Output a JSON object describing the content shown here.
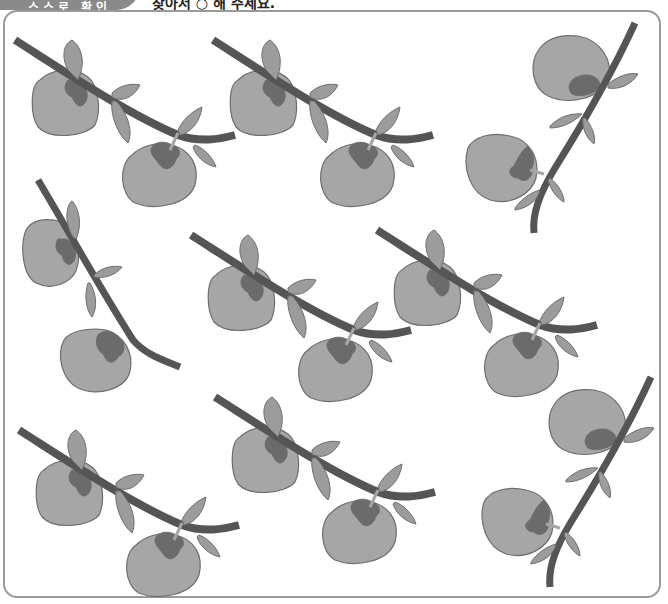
{
  "header": {
    "badge_text": "스스로 확인",
    "title": "찾아서 ○ 해 주세요."
  },
  "colors": {
    "fruit": "#a6a6a6",
    "fruit_stroke": "#6e6e6e",
    "calyx": "#6b6b6b",
    "branch": "#555555",
    "leaf": "#9c9c9c",
    "frame": "#9a9a9a"
  },
  "groups": [
    {
      "id": "g1",
      "variant": "horizontal",
      "x": 10,
      "y": 35,
      "flip": false,
      "rotate": 0
    },
    {
      "id": "g2",
      "variant": "horizontal",
      "x": 208,
      "y": 35,
      "flip": false,
      "rotate": 0
    },
    {
      "id": "g3",
      "variant": "diagonal",
      "x": 460,
      "y": 18,
      "flip": false,
      "rotate": 0
    },
    {
      "id": "g4",
      "variant": "bent",
      "x": 18,
      "y": 175,
      "flip": false,
      "rotate": 0
    },
    {
      "id": "g5",
      "variant": "horizontal",
      "x": 186,
      "y": 230,
      "flip": false,
      "rotate": 0
    },
    {
      "id": "g6",
      "variant": "horizontal",
      "x": 372,
      "y": 225,
      "flip": false,
      "rotate": 0
    },
    {
      "id": "g7",
      "variant": "horizontal",
      "x": 14,
      "y": 425,
      "flip": false,
      "rotate": 0
    },
    {
      "id": "g8",
      "variant": "horizontal",
      "x": 210,
      "y": 392,
      "flip": false,
      "rotate": 0
    },
    {
      "id": "g9",
      "variant": "diagonal",
      "x": 476,
      "y": 372,
      "flip": false,
      "rotate": 0
    }
  ]
}
